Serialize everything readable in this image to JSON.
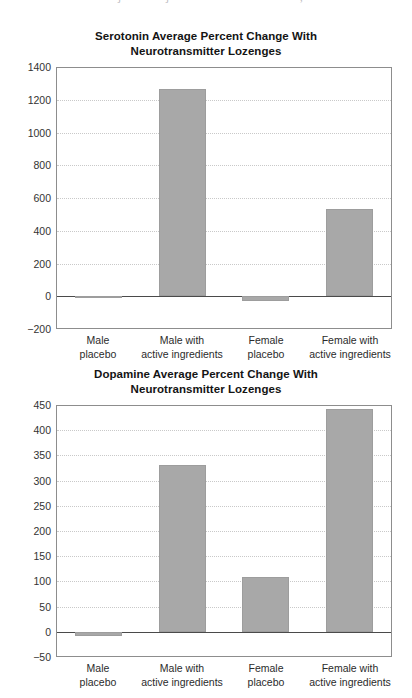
{
  "page": {
    "top_artifact_text": "j      j                    ,"
  },
  "colors": {
    "bar_fill": "#a8a8a8",
    "bar_stroke": "#9d9d9d",
    "axis": "#8d8d8d",
    "gridline": "#c9c9c9",
    "zeroline": "#4a4a4a",
    "text": "#1a1a1a"
  },
  "categories": [
    {
      "line1": "Male",
      "line2": "placebo"
    },
    {
      "line1": "Male with",
      "line2": "active ingredients"
    },
    {
      "line1": "Female",
      "line2": "placebo"
    },
    {
      "line1": "Female with",
      "line2": "active ingredients"
    }
  ],
  "chart_data": [
    {
      "type": "bar",
      "title": "Serotonin Average Percent Change With Neurotransmitter Lozenges",
      "title_line1": "Serotonin Average Percent Change With",
      "title_line2": "Neurotransmitter Lozenges",
      "xlabel": "",
      "ylabel": "",
      "ylim": [
        -200,
        1400
      ],
      "ytick_step": 200,
      "yticks": [
        1400,
        1200,
        1000,
        800,
        600,
        400,
        200,
        0,
        -200
      ],
      "ytick_labels": [
        "1400",
        "1200",
        "1000",
        "800",
        "600",
        "400",
        "200",
        "0",
        "−200"
      ],
      "grid": true,
      "legend": "none",
      "categories": [
        "Male placebo",
        "Male with active ingredients",
        "Female placebo",
        "Female with active ingredients"
      ],
      "values": [
        0,
        1265,
        -30,
        530
      ]
    },
    {
      "type": "bar",
      "title": "Dopamine Average Percent Change With Neurotransmitter Lozenges",
      "title_line1": "Dopamine Average Percent Change With",
      "title_line2": "Neurotransmitter Lozenges",
      "xlabel": "",
      "ylabel": "",
      "ylim": [
        -50,
        450
      ],
      "ytick_step": 50,
      "yticks": [
        450,
        400,
        350,
        300,
        250,
        200,
        150,
        100,
        50,
        0,
        -50
      ],
      "ytick_labels": [
        "450",
        "400",
        "350",
        "300",
        "250",
        "200",
        "150",
        "100",
        "50",
        "0",
        "−50"
      ],
      "grid": true,
      "legend": "none",
      "categories": [
        "Male placebo",
        "Male with active ingredients",
        "Female placebo",
        "Female with active ingredients"
      ],
      "values": [
        -8,
        330,
        108,
        443
      ]
    }
  ]
}
